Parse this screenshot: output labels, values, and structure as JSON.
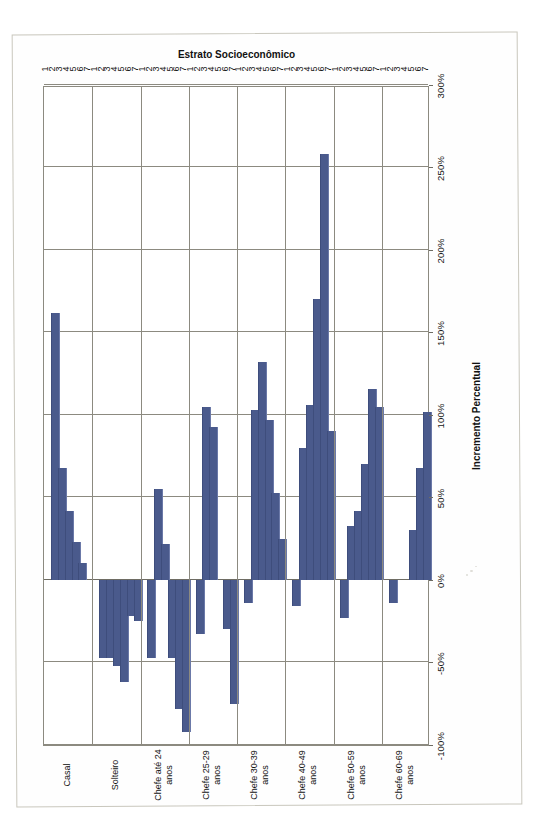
{
  "chart_data": {
    "type": "bar",
    "orientation": "horizontal",
    "title": "",
    "xlabel": "Incremento Percentual",
    "ylabel": "Estrato Socioeconômico",
    "xlim": [
      -100,
      300
    ],
    "xticks": [
      "-100%",
      "-50%",
      "0%",
      "50%",
      "100%",
      "150%",
      "200%",
      "250%",
      "300%"
    ],
    "xtick_values": [
      -100,
      -50,
      0,
      50,
      100,
      150,
      200,
      250,
      300
    ],
    "grid": true,
    "legend": "none",
    "category_tick_labels": [
      "1",
      "2",
      "3",
      "4",
      "5",
      "6",
      "7"
    ],
    "groups": [
      {
        "name": "Casal",
        "strata": [
          "1",
          "2",
          "3",
          "4",
          "5",
          "6",
          "7"
        ],
        "values": [
          null,
          162,
          68,
          42,
          23,
          10,
          null
        ]
      },
      {
        "name": "Solteiro",
        "strata": [
          "1",
          "2",
          "3",
          "4",
          "5",
          "6",
          "7"
        ],
        "values": [
          null,
          -47,
          -47,
          -52,
          -62,
          -22,
          -25
        ]
      },
      {
        "name": "Chefe até 24 anos",
        "strata": [
          "1",
          "2",
          "3",
          "4",
          "5",
          "6",
          "7"
        ],
        "values": [
          null,
          -47,
          55,
          22,
          -47,
          -78,
          -92
        ]
      },
      {
        "name": "Chefe 25-29 anos",
        "strata": [
          "1",
          "2",
          "3",
          "4",
          "5",
          "6",
          "7"
        ],
        "values": [
          null,
          -33,
          105,
          93,
          null,
          -30,
          -75
        ]
      },
      {
        "name": "Chefe 30-39 anos",
        "strata": [
          "1",
          "2",
          "3",
          "4",
          "5",
          "6",
          "7"
        ],
        "values": [
          null,
          -14,
          103,
          132,
          97,
          53,
          25
        ]
      },
      {
        "name": "Chefe 40-49 anos",
        "strata": [
          "1",
          "2",
          "3",
          "4",
          "5",
          "6",
          "7"
        ],
        "values": [
          null,
          -16,
          80,
          106,
          170,
          258,
          90
        ]
      },
      {
        "name": "Chefe 50-59 anos",
        "strata": [
          "1",
          "2",
          "3",
          "4",
          "5",
          "6",
          "7"
        ],
        "values": [
          null,
          -23,
          33,
          42,
          70,
          116,
          105
        ]
      },
      {
        "name": "Chefe 60-69 anos",
        "strata": [
          "1",
          "2",
          "3",
          "4",
          "5",
          "6",
          "7"
        ],
        "values": [
          null,
          -14,
          null,
          null,
          30,
          68,
          102
        ]
      }
    ],
    "series_color": "#4a5a8c"
  },
  "axis": {
    "x_title": "Incremento Percentual",
    "y_title": "Estrato Socioeconômico"
  }
}
